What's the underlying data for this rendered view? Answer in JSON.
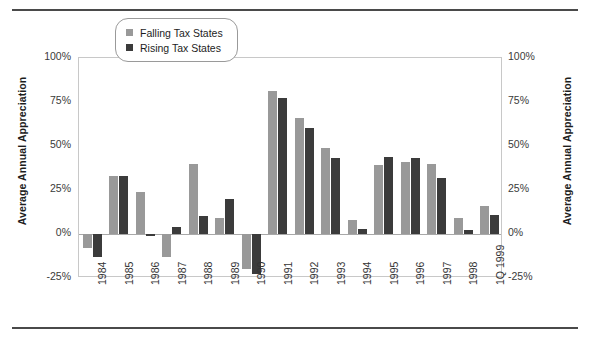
{
  "chart_data": {
    "type": "bar",
    "title": "",
    "xlabel": "",
    "ylabel": "Average Annual Appreciation",
    "ylabel_right": "Average Annual Appreciation",
    "ylim": [
      -25,
      100
    ],
    "yticks": [
      "-25%",
      "0%",
      "25%",
      "50%",
      "75%",
      "100%"
    ],
    "ytick_values": [
      -25,
      0,
      25,
      50,
      75,
      100
    ],
    "grid": false,
    "legend_position": "top-center",
    "categories": [
      "1984",
      "1985",
      "1986",
      "1987",
      "1988",
      "1989",
      "1990",
      "1991",
      "1992",
      "1993",
      "1994",
      "1995",
      "1996",
      "1997",
      "1998",
      "1Q 1999"
    ],
    "series": [
      {
        "name": "Falling Tax States",
        "color": "#999999",
        "values": [
          -8,
          33,
          24,
          -13,
          40,
          9,
          -20,
          81,
          66,
          49,
          8,
          39,
          41,
          40,
          9,
          16
        ]
      },
      {
        "name": "Rising Tax States",
        "color": "#3b3b3b",
        "values": [
          -13,
          33,
          -1,
          4,
          10,
          20,
          -23,
          77,
          60,
          43,
          3,
          44,
          43,
          32,
          2,
          11
        ]
      }
    ]
  },
  "legend": {
    "items": [
      {
        "label": "Falling Tax States",
        "key": "falling"
      },
      {
        "label": "Rising Tax States",
        "key": "rising"
      }
    ]
  },
  "colors": {
    "falling": "#999999",
    "rising": "#3b3b3b",
    "rule": "#4a4a4a",
    "frame": "#c8c8c8",
    "zero_line": "#a8a8a8",
    "text": "#262626"
  }
}
